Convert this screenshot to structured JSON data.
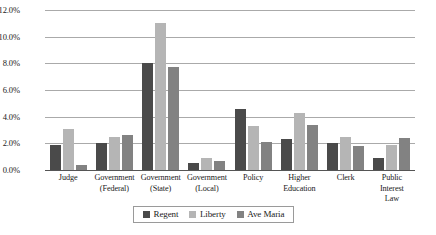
{
  "chart_data": {
    "type": "bar",
    "title": "",
    "subtitle": "",
    "xlabel": "",
    "ylabel": "",
    "ylim": [
      0,
      12
    ],
    "ytick_labels": [
      "12.0%",
      "10.0%",
      "8.0%",
      "6.0%",
      "4.0%",
      "2.0%",
      "0.0%"
    ],
    "ytick_values": [
      12,
      10,
      8,
      6,
      4,
      2,
      0
    ],
    "grid": true,
    "legend_position": "bottom",
    "categories": [
      "Judge",
      "Government (Federal)",
      "Government (State)",
      "Government (Local)",
      "Policy",
      "Higher Education",
      "Clerk",
      "Public Interest Law"
    ],
    "category_lines": [
      [
        "Judge"
      ],
      [
        "Government",
        "(Federal)"
      ],
      [
        "Government",
        "(State)"
      ],
      [
        "Government",
        "(Local)"
      ],
      [
        "Policy"
      ],
      [
        "Higher",
        "Education"
      ],
      [
        "Clerk"
      ],
      [
        "Public Interest",
        "Law"
      ]
    ],
    "series": [
      {
        "name": "Regent",
        "color": "#4a4a4a",
        "values": [
          1.85,
          2.0,
          8.0,
          0.5,
          4.6,
          2.3,
          2.0,
          0.9
        ]
      },
      {
        "name": "Liberty",
        "color": "#b5b5b5",
        "values": [
          3.1,
          2.5,
          11.0,
          0.9,
          3.3,
          4.3,
          2.5,
          1.9
        ]
      },
      {
        "name": "Ave Maria",
        "color": "#828282",
        "values": [
          0.4,
          2.6,
          7.7,
          0.7,
          2.1,
          3.4,
          1.8,
          2.4
        ]
      }
    ]
  }
}
